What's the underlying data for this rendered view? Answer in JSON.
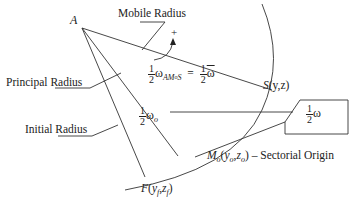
{
  "diagram": {
    "type": "sectorial-coordinate-diagram",
    "points": {
      "pole": "A",
      "s_point": {
        "name": "S",
        "coords": "(y,z)"
      },
      "origin": {
        "name": "M",
        "sub": "o",
        "coords_y": "y",
        "coords_z": "z",
        "coord_sub": "o",
        "suffix": "– Sectorial Origin"
      },
      "initial": {
        "name": "F",
        "coords_y": "y",
        "coords_z": "z",
        "coord_sub": "f"
      }
    },
    "labels": {
      "mobile_radius": "Mobile Radius",
      "principal_radius": "Principal Radius",
      "initial_radius": "Initial Radius",
      "direction_sign": "+"
    },
    "formulas": {
      "half_num": "1",
      "half_den": "2",
      "omega": "ω",
      "omega_bar": "ω",
      "omega_sub_AMS": "AM",
      "omega_sub_o_small": "o",
      "omega_sub_S": "S",
      "equals": "=",
      "omega_o_sub": "o"
    },
    "boxed_label": {
      "num": "1",
      "den": "2",
      "symbol": "ω"
    }
  }
}
